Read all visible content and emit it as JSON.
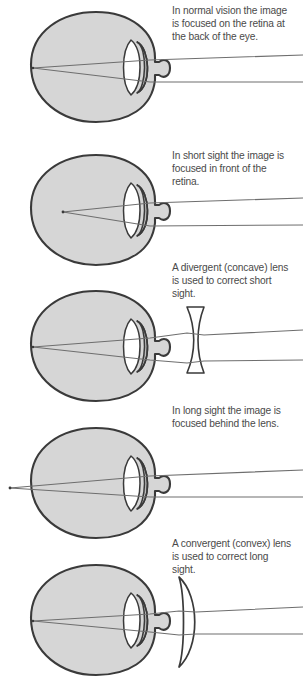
{
  "figure": {
    "colors": {
      "eye_fill": "#d6d6d6",
      "outline": "#3a3a3a",
      "lens_fill": "#ffffff",
      "ray": "#6e6e6e",
      "text": "#4a4a4a",
      "background": "#ffffff"
    },
    "panels": [
      {
        "id": "normal-vision",
        "caption": "In normal vision the image\nis focused on the retina at\nthe back of the eye.",
        "has_corrective_lens": false,
        "lens_type": "none",
        "focus_location": "on the retina"
      },
      {
        "id": "short-sight",
        "caption": "In short sight the image is\nfocused in front of the\nretina.",
        "has_corrective_lens": false,
        "lens_type": "none",
        "focus_location": "in front of the retina"
      },
      {
        "id": "short-sight-corrected",
        "caption": "A divergent (concave) lens\nis used to correct short\nsight.",
        "has_corrective_lens": true,
        "lens_type": "divergent-concave",
        "focus_location": "on the retina"
      },
      {
        "id": "long-sight",
        "caption": "In long sight the image is\nfocused behind the lens.",
        "has_corrective_lens": false,
        "lens_type": "none",
        "focus_location": "behind the retina"
      },
      {
        "id": "long-sight-corrected",
        "caption": "A convergent (convex) lens\nis used to correct long\nsight.",
        "has_corrective_lens": true,
        "lens_type": "convergent-convex",
        "focus_location": "on the retina"
      }
    ]
  }
}
